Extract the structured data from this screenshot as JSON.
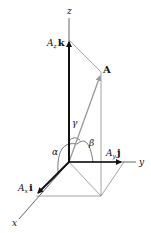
{
  "diagram": {
    "axes": {
      "x_label": "x",
      "y_label": "y",
      "z_label": "z"
    },
    "vector": {
      "label": "A"
    },
    "components": {
      "x": {
        "coef": "A",
        "sub": "x",
        "unit": "i"
      },
      "y": {
        "coef": "A",
        "sub": "y",
        "unit": "j"
      },
      "z": {
        "coef": "A",
        "sub": "z",
        "unit": "k"
      }
    },
    "angles": {
      "alpha": "α",
      "beta": "β",
      "gamma": "γ"
    },
    "colors": {
      "axis": "#222222",
      "vector": "#999999",
      "construction": "#666666",
      "component": "#111111"
    }
  }
}
